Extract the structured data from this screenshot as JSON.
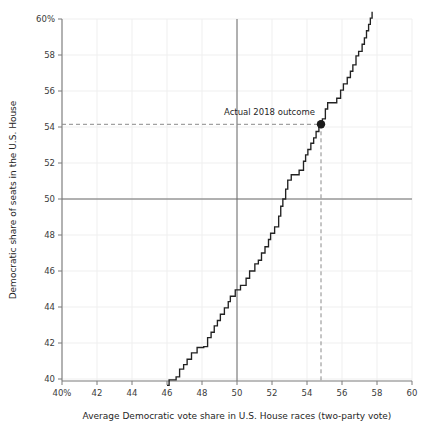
{
  "chart": {
    "type": "line",
    "title": "",
    "xlabel": "Average Democratic vote share in U.S. House races (two-party vote)",
    "ylabel": "Democratic share of seats in the U.S. House",
    "xlim": [
      40,
      60
    ],
    "ylim": [
      39.2,
      60.6
    ],
    "grid": true,
    "legend_position": "none",
    "x_ticks": [
      "40%",
      "42",
      "44",
      "46",
      "48",
      "50",
      "52",
      "54",
      "56",
      "58",
      "60"
    ],
    "x_tick_values": [
      40,
      42,
      44,
      46,
      48,
      50,
      52,
      54,
      56,
      58,
      60
    ],
    "y_ticks": [
      "40",
      "42",
      "44",
      "46",
      "48",
      "50",
      "52",
      "54",
      "56",
      "58",
      "60%"
    ],
    "y_tick_values": [
      40,
      42,
      44,
      46,
      48,
      50,
      52,
      54,
      56,
      58,
      60
    ],
    "reference_lines": {
      "vertical_x": 50,
      "horizontal_y": 50,
      "color": "#6b6b6b"
    },
    "annotation": {
      "label": "Actual 2018 outcome",
      "x": 54.8,
      "y": 54.15,
      "marker_color": "#1a1a1a",
      "guide_style": "dashed",
      "guide_color": "#8a8a8a"
    },
    "series": [
      {
        "name": "Seats-votes curve",
        "color": "#222222",
        "points": [
          [
            46.0,
            39.65
          ],
          [
            46.12,
            39.65
          ],
          [
            46.12,
            39.95
          ],
          [
            46.52,
            39.95
          ],
          [
            46.52,
            40.12
          ],
          [
            46.72,
            40.12
          ],
          [
            46.72,
            40.55
          ],
          [
            46.95,
            40.55
          ],
          [
            46.95,
            40.8
          ],
          [
            47.15,
            40.8
          ],
          [
            47.15,
            41.1
          ],
          [
            47.4,
            41.1
          ],
          [
            47.4,
            41.45
          ],
          [
            47.72,
            41.45
          ],
          [
            47.72,
            41.75
          ],
          [
            48.1,
            41.75
          ],
          [
            48.1,
            41.8
          ],
          [
            48.32,
            41.8
          ],
          [
            48.32,
            42.3
          ],
          [
            48.52,
            42.3
          ],
          [
            48.52,
            42.6
          ],
          [
            48.7,
            42.6
          ],
          [
            48.7,
            42.95
          ],
          [
            48.88,
            42.95
          ],
          [
            48.88,
            43.25
          ],
          [
            49.05,
            43.25
          ],
          [
            49.05,
            43.6
          ],
          [
            49.28,
            43.6
          ],
          [
            49.28,
            43.95
          ],
          [
            49.5,
            43.95
          ],
          [
            49.5,
            44.3
          ],
          [
            49.62,
            44.3
          ],
          [
            49.62,
            44.6
          ],
          [
            49.9,
            44.6
          ],
          [
            49.9,
            44.95
          ],
          [
            50.2,
            44.95
          ],
          [
            50.2,
            45.2
          ],
          [
            50.52,
            45.2
          ],
          [
            50.52,
            45.6
          ],
          [
            50.72,
            45.6
          ],
          [
            50.72,
            46.0
          ],
          [
            51.02,
            46.0
          ],
          [
            51.02,
            46.4
          ],
          [
            51.22,
            46.4
          ],
          [
            51.22,
            46.6
          ],
          [
            51.4,
            46.6
          ],
          [
            51.4,
            47.0
          ],
          [
            51.6,
            47.0
          ],
          [
            51.6,
            47.35
          ],
          [
            51.8,
            47.35
          ],
          [
            51.8,
            47.75
          ],
          [
            51.92,
            47.75
          ],
          [
            51.92,
            48.1
          ],
          [
            52.15,
            48.1
          ],
          [
            52.15,
            48.45
          ],
          [
            52.38,
            48.45
          ],
          [
            52.38,
            49.05
          ],
          [
            52.5,
            49.05
          ],
          [
            52.5,
            49.6
          ],
          [
            52.62,
            49.6
          ],
          [
            52.62,
            50.0
          ],
          [
            52.78,
            50.0
          ],
          [
            52.78,
            50.55
          ],
          [
            52.9,
            50.55
          ],
          [
            52.9,
            51.05
          ],
          [
            53.1,
            51.05
          ],
          [
            53.1,
            51.35
          ],
          [
            53.55,
            51.35
          ],
          [
            53.55,
            51.6
          ],
          [
            53.8,
            51.6
          ],
          [
            53.8,
            52.1
          ],
          [
            53.92,
            52.1
          ],
          [
            53.92,
            52.45
          ],
          [
            54.05,
            52.45
          ],
          [
            54.05,
            52.75
          ],
          [
            54.22,
            52.75
          ],
          [
            54.22,
            53.1
          ],
          [
            54.38,
            53.1
          ],
          [
            54.38,
            53.4
          ],
          [
            54.52,
            53.4
          ],
          [
            54.52,
            53.75
          ],
          [
            54.68,
            53.75
          ],
          [
            54.68,
            54.1
          ],
          [
            54.88,
            54.1
          ],
          [
            54.88,
            54.45
          ],
          [
            55.05,
            54.45
          ],
          [
            55.05,
            55.0
          ],
          [
            55.18,
            55.0
          ],
          [
            55.18,
            55.35
          ],
          [
            55.7,
            55.35
          ],
          [
            55.7,
            55.6
          ],
          [
            55.92,
            55.6
          ],
          [
            55.92,
            56.05
          ],
          [
            56.08,
            56.05
          ],
          [
            56.08,
            56.4
          ],
          [
            56.3,
            56.4
          ],
          [
            56.3,
            56.75
          ],
          [
            56.48,
            56.75
          ],
          [
            56.48,
            57.1
          ],
          [
            56.62,
            57.1
          ],
          [
            56.62,
            57.45
          ],
          [
            56.8,
            57.45
          ],
          [
            56.8,
            57.95
          ],
          [
            56.95,
            57.95
          ],
          [
            56.95,
            58.2
          ],
          [
            57.15,
            58.2
          ],
          [
            57.15,
            58.6
          ],
          [
            57.28,
            58.6
          ],
          [
            57.28,
            58.95
          ],
          [
            57.4,
            58.95
          ],
          [
            57.4,
            59.35
          ],
          [
            57.52,
            59.35
          ],
          [
            57.52,
            59.7
          ],
          [
            57.62,
            59.7
          ],
          [
            57.62,
            60.05
          ],
          [
            57.72,
            60.05
          ],
          [
            57.72,
            60.4
          ]
        ]
      }
    ]
  }
}
